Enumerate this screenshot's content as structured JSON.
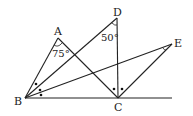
{
  "diagram": {
    "type": "geometry",
    "points": {
      "A": {
        "label": "A",
        "x": 58,
        "y": 38
      },
      "B": {
        "label": "B",
        "x": 25,
        "y": 98
      },
      "C": {
        "label": "C",
        "x": 118,
        "y": 98
      },
      "D": {
        "label": "D",
        "x": 117,
        "y": 18
      },
      "E": {
        "label": "E",
        "x": 172,
        "y": 44
      }
    },
    "segments": [
      [
        "B",
        "A"
      ],
      [
        "A",
        "C"
      ],
      [
        "B",
        "D"
      ],
      [
        "D",
        "C"
      ],
      [
        "B",
        "E"
      ],
      [
        "E",
        "C"
      ],
      [
        "B",
        "C_ext"
      ]
    ],
    "angles": {
      "A": "75°",
      "D": "50°"
    },
    "equal_angle_marks": {
      "B": "three equal angles marked with dots (BA, BD, BE, BC)",
      "C": "two equal angles marked with dots (CD, CE)"
    }
  }
}
